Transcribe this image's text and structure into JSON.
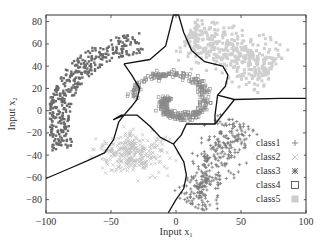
{
  "chart_data": {
    "type": "scatter",
    "title": "",
    "xlabel": "Input x₁",
    "ylabel": "Input x₂",
    "xlabel_main": "Input x",
    "xlabel_sub": "1",
    "ylabel_main": "Input x",
    "ylabel_sub": "2",
    "xlim": [
      -100,
      100
    ],
    "ylim": [
      -92,
      86
    ],
    "xticks": [
      -100,
      -50,
      0,
      50,
      100
    ],
    "yticks": [
      -80,
      -60,
      -40,
      -20,
      0,
      20,
      40,
      60,
      80
    ],
    "grid": false,
    "legend_position": "right-center inside",
    "legend": [
      {
        "label": "class1",
        "marker": "+"
      },
      {
        "label": "class2",
        "marker": "×"
      },
      {
        "label": "class3",
        "marker": "✳"
      },
      {
        "label": "class4",
        "marker": "□"
      },
      {
        "label": "class5",
        "marker": "■"
      }
    ],
    "series": [
      {
        "name": "class1",
        "marker": "plus",
        "color": "#7a7a7a",
        "region": "bottom-right diagonal band",
        "center": [
          40,
          -45
        ],
        "approx_extent": {
          "x": [
            5,
            55
          ],
          "y": [
            -90,
            -10
          ]
        }
      },
      {
        "name": "class2",
        "marker": "x",
        "color": "#c4c4c4",
        "region": "bottom-left blob",
        "center": [
          -35,
          -40
        ],
        "approx_extent": {
          "x": [
            -60,
            -5
          ],
          "y": [
            -60,
            -15
          ]
        }
      },
      {
        "name": "class3",
        "marker": "asterisk",
        "color": "#6a6a6a",
        "region": "top-left arc",
        "center": [
          -75,
          20
        ],
        "approx_extent": {
          "x": [
            -95,
            -15
          ],
          "y": [
            -45,
            65
          ]
        }
      },
      {
        "name": "class4",
        "marker": "square-open",
        "color": "#8a8a8a",
        "region": "center spiral",
        "center": [
          0,
          10
        ],
        "approx_extent": {
          "x": [
            -30,
            35
          ],
          "y": [
            -20,
            35
          ]
        }
      },
      {
        "name": "class5",
        "marker": "square-filled",
        "color": "#cfcfcf",
        "region": "top-right blob",
        "center": [
          40,
          50
        ],
        "approx_extent": {
          "x": [
            10,
            75
          ],
          "y": [
            25,
            78
          ]
        }
      }
    ],
    "decision_boundaries": [
      {
        "name": "star-center",
        "points": [
          [
            -40,
            42
          ],
          [
            -20,
            46
          ],
          [
            -8,
            58
          ],
          [
            -2,
            86
          ],
          [
            2,
            86
          ],
          [
            6,
            70
          ],
          [
            12,
            54
          ],
          [
            22,
            44
          ],
          [
            36,
            40
          ],
          [
            40,
            32
          ],
          [
            38,
            22
          ],
          [
            32,
            14
          ],
          [
            45,
            10
          ],
          [
            80,
            11
          ],
          [
            100,
            11
          ]
        ]
      },
      {
        "name": "star-lower-right",
        "points": [
          [
            32,
            14
          ],
          [
            30,
            -4
          ],
          [
            30,
            -12
          ],
          [
            8,
            -12
          ],
          [
            4,
            -22
          ],
          [
            -2,
            -30
          ],
          [
            -12,
            -24
          ],
          [
            -20,
            -14
          ],
          [
            -30,
            -4
          ],
          [
            -38,
            -4
          ],
          [
            -42,
            -4
          ],
          [
            -48,
            -8
          ],
          [
            -40,
            -4
          ]
        ]
      },
      {
        "name": "star-left",
        "points": [
          [
            -40,
            42
          ],
          [
            -34,
            32
          ],
          [
            -28,
            20
          ],
          [
            -30,
            10
          ],
          [
            -34,
            4
          ],
          [
            -40,
            -4
          ]
        ]
      },
      {
        "name": "left-lower",
        "points": [
          [
            -100,
            -61
          ],
          [
            -82,
            -52
          ],
          [
            -68,
            -45
          ],
          [
            -55,
            -38
          ],
          [
            -48,
            -26
          ],
          [
            -44,
            -10
          ],
          [
            -40,
            -4
          ]
        ]
      },
      {
        "name": "bottom-middle",
        "points": [
          [
            -2,
            -30
          ],
          [
            2,
            -38
          ],
          [
            6,
            -46
          ],
          [
            8,
            -58
          ],
          [
            6,
            -70
          ],
          [
            0,
            -80
          ],
          [
            -6,
            -92
          ]
        ]
      },
      {
        "name": "right-join",
        "points": [
          [
            30,
            -12
          ],
          [
            45,
            10
          ]
        ]
      }
    ]
  },
  "clusters_render": [
    {
      "series": 2,
      "kind": "arc",
      "seed": 11,
      "count": 380,
      "cx": -20,
      "cy": -10,
      "r0": 62,
      "r1": 80,
      "a0": 95,
      "a1": 200
    },
    {
      "series": 4,
      "kind": "band",
      "seed": 23,
      "count": 420,
      "x0": 10,
      "y0": 72,
      "x1": 75,
      "y1": 35,
      "w": 22
    },
    {
      "series": 3,
      "kind": "spiral",
      "seed": 37,
      "count": 360
    },
    {
      "series": 1,
      "kind": "blob",
      "seed": 41,
      "count": 300,
      "cx": -33,
      "cy": -38,
      "rx": 24,
      "ry": 16
    },
    {
      "series": 0,
      "kind": "band",
      "seed": 53,
      "count": 330,
      "x0": 12,
      "y0": -86,
      "x1": 48,
      "y1": -10,
      "w": 18
    }
  ]
}
